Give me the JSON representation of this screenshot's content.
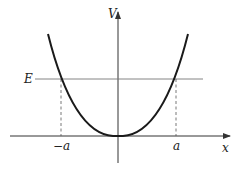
{
  "diagram": {
    "labels": {
      "y_axis": "V",
      "x_axis": "x",
      "energy": "E",
      "left_turning_point": "−a",
      "right_turning_point": "a"
    },
    "colors": {
      "background": "#ffffff",
      "curve": "#1a1a1a",
      "axes": "#333333",
      "energy_line": "#666666",
      "dashed": "#555555"
    },
    "elements": [
      {
        "type": "axis",
        "name": "x-axis",
        "direction": "horizontal",
        "arrow": "right"
      },
      {
        "type": "axis",
        "name": "V-axis",
        "direction": "vertical",
        "arrow": "up"
      },
      {
        "type": "curve",
        "name": "potential-curve",
        "shape": "parabola-like, minimum at origin"
      },
      {
        "type": "line",
        "name": "energy-level",
        "orientation": "horizontal"
      },
      {
        "type": "dashed-line",
        "name": "turning-point-left",
        "from": "curve∩E",
        "to": "x-axis at −a"
      },
      {
        "type": "dashed-line",
        "name": "turning-point-right",
        "from": "curve∩E",
        "to": "x-axis at a"
      }
    ]
  }
}
